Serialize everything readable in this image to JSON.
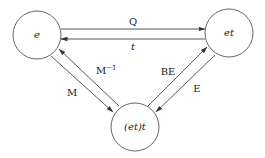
{
  "diagram": {
    "type": "state-transition",
    "nodes": [
      {
        "id": "e",
        "label": "e",
        "cx": 37,
        "cy": 35,
        "r": 24
      },
      {
        "id": "et",
        "label": "et",
        "cx": 229,
        "cy": 33,
        "r": 24
      },
      {
        "id": "ett",
        "label": "(et)t",
        "cx": 135,
        "cy": 127,
        "r": 24
      }
    ],
    "edges": [
      {
        "from": "e",
        "to": "et",
        "label": "Q"
      },
      {
        "from": "et",
        "to": "e",
        "label": "t"
      },
      {
        "from": "e",
        "to": "ett",
        "label": "M"
      },
      {
        "from": "ett",
        "to": "e",
        "label": "M",
        "label_sup": "−1"
      },
      {
        "from": "ett",
        "to": "et",
        "label": "BE"
      },
      {
        "from": "et",
        "to": "ett",
        "label": "E"
      }
    ]
  }
}
